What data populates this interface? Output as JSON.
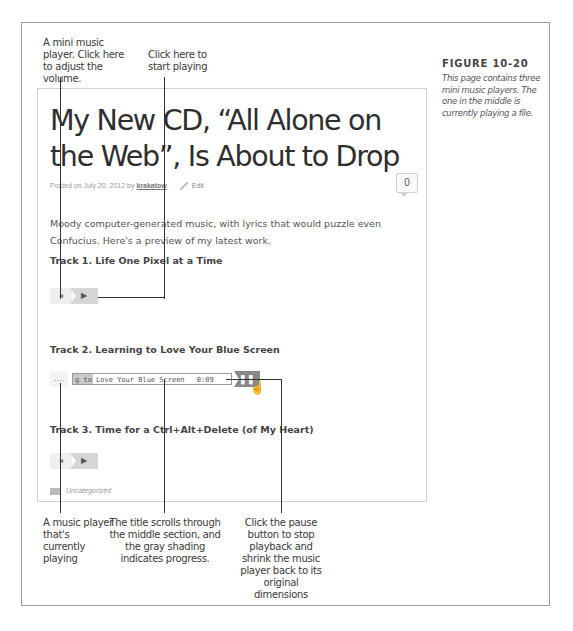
{
  "figure": {
    "label": "FIGURE 10-20",
    "caption": "This page contains three mini music players. The one in the middle is currently playing a file."
  },
  "callouts": {
    "volume": "A mini music player. Click here to adjust the volume.",
    "play": "Click here to start playing",
    "currently_playing": "A music player that's currently playing",
    "title_scrolls": "The title scrolls through the middle section, and the gray shading indicates progress.",
    "pause": "Click the pause button to stop playback and shrink the music player back to its original dimensions"
  },
  "post": {
    "title": "My New CD, “All Alone on the Web”, Is About to Drop",
    "meta_prefix": "Posted on July 20, 2012 by",
    "author": "krakatow",
    "edit_label": "Edit",
    "comment_count": "0",
    "intro": "Moody computer-generated music, with lyrics that would puzzle even Confucius. Here's a preview of my latest work.",
    "category": "Uncategorized"
  },
  "tracks": [
    {
      "title": "Track 1. Life One Pixel at a Time",
      "state": "stopped",
      "volume_icon": "◂",
      "play_icon": "▶"
    },
    {
      "title": "Track 2. Learning to Love Your Blue Screen",
      "state": "playing",
      "volume_icon": "․…",
      "ticker_text": "g to Love Your Blue Screen",
      "time": "0:09",
      "pause_icon": "❚❚"
    },
    {
      "title": "Track 3. Time for a Ctrl+Alt+Delete (of My Heart)",
      "state": "stopped",
      "volume_icon": "◂",
      "play_icon": "▶"
    }
  ]
}
